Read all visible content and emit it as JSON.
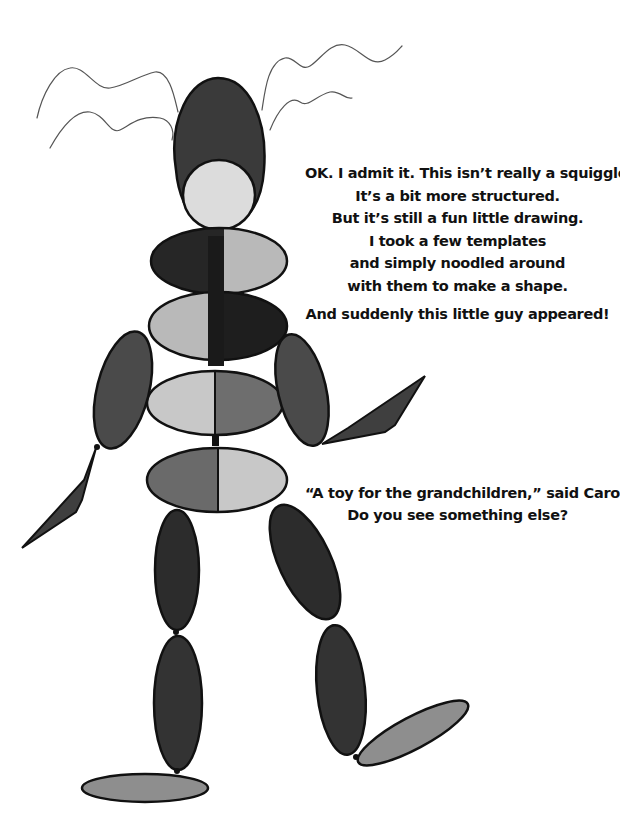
{
  "illustration": {
    "subject": "stick-figure toy made of template ellipses",
    "colors": {
      "outline": "#111111",
      "dark": "#2e2e2e",
      "mid_dark": "#4a4a4a",
      "mid": "#6e6e6e",
      "light": "#b9b9b9",
      "lighter": "#d6d6d6",
      "face": "#dcdcdc",
      "squiggle": "#555555"
    }
  },
  "text": {
    "paragraph1": [
      "OK. I admit it. This isn’t really a squiggle.",
      "It’s a bit more structured.",
      "But it’s still a fun little drawing.",
      "I took a few templates",
      "and simply noodled around",
      "with them to make a shape.",
      "And suddenly this little guy appeared!"
    ],
    "paragraph2": [
      "“A toy for the grandchildren,” said Carol.",
      "Do you see something else?"
    ]
  }
}
